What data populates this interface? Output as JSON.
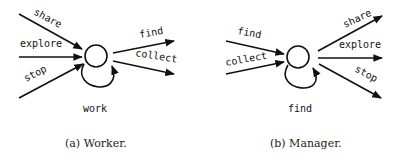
{
  "figures": [
    {
      "id": "a",
      "caption": "(a) Worker.",
      "node": "circle",
      "incoming": [
        "share",
        "explore",
        "stop"
      ],
      "outgoing": [
        "find",
        "collect"
      ],
      "self_loop": "work"
    },
    {
      "id": "b",
      "caption": "(b) Manager.",
      "node": "circle",
      "incoming": [
        "find",
        "collect"
      ],
      "outgoing": [
        "share",
        "explore",
        "stop"
      ],
      "self_loop": "find"
    }
  ],
  "colors": {
    "stroke": "#111111",
    "background": "#ffffff"
  }
}
